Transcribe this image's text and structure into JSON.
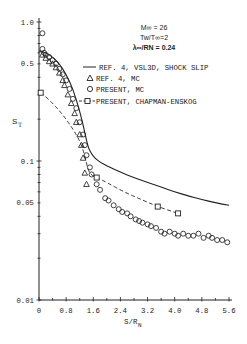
{
  "chart_data": {
    "type": "scatter",
    "title": "",
    "xlabel": "S/R",
    "xlabel_sub": "N",
    "ylabel": "S",
    "ylabel_sub": "T",
    "yscale": "log",
    "xlim": [
      0,
      5.6
    ],
    "ylim": [
      0.01,
      1.0
    ],
    "xticks": [
      0,
      0.4,
      0.8,
      1.2,
      1.6,
      2.0,
      2.4,
      2.8,
      3.2,
      3.6,
      4.0,
      4.4,
      4.8,
      5.2,
      5.6
    ],
    "xtick_labels": [
      {
        "v": 0,
        "t": "0"
      },
      {
        "v": 0.8,
        "t": "0.8"
      },
      {
        "v": 1.6,
        "t": "1.6"
      },
      {
        "v": 2.4,
        "t": "2.4"
      },
      {
        "v": 3.2,
        "t": "3.2"
      },
      {
        "v": 4.0,
        "t": "4.0"
      },
      {
        "v": 4.8,
        "t": "4.8"
      },
      {
        "v": 5.6,
        "t": "5.6"
      }
    ],
    "yticks": [
      0.01,
      0.02,
      0.03,
      0.04,
      0.05,
      0.06,
      0.07,
      0.08,
      0.09,
      0.1,
      0.2,
      0.3,
      0.4,
      0.5,
      0.6,
      0.7,
      0.8,
      0.9,
      1.0
    ],
    "ytick_labels": [
      {
        "v": 1.0,
        "t": "1.0"
      },
      {
        "v": 0.5,
        "t": "0.5"
      },
      {
        "v": 0.1,
        "t": "0.1"
      },
      {
        "v": 0.05,
        "t": "0.05"
      },
      {
        "v": 0.01,
        "t": "0.01"
      }
    ],
    "grid": false,
    "annotation": {
      "line1": "M∞ = 26",
      "line2": "Tw/T∞=2",
      "line3": "λ∞/RN = 0.24"
    },
    "legend": [
      {
        "marker": "line",
        "label": "REF. 4, VSL3D, SHOCK SLIP"
      },
      {
        "marker": "triangle",
        "label": "REF. 4, MC"
      },
      {
        "marker": "circle",
        "label": "PRESENT, MC"
      },
      {
        "marker": "dash-square",
        "label": "PRESENT, CHAPMAN-ENSKOG"
      }
    ],
    "series": [
      {
        "name": "REF. 4, VSL3D, SHOCK SLIP",
        "style": "solid",
        "x": [
          0.0,
          0.2,
          0.4,
          0.6,
          0.8,
          1.0,
          1.2,
          1.35,
          1.45,
          1.55,
          1.65,
          1.8,
          2.0,
          2.4,
          2.8,
          3.2,
          3.6,
          4.0,
          4.4,
          4.8,
          5.2,
          5.6
        ],
        "y": [
          0.62,
          0.6,
          0.56,
          0.5,
          0.42,
          0.33,
          0.23,
          0.16,
          0.125,
          0.112,
          0.105,
          0.098,
          0.092,
          0.083,
          0.076,
          0.07,
          0.065,
          0.06,
          0.056,
          0.053,
          0.05,
          0.048
        ]
      },
      {
        "name": "REF. 4, MC",
        "style": "triangle",
        "x": [
          0.1,
          0.2,
          0.3,
          0.4,
          0.5,
          0.6,
          0.7,
          0.75,
          0.85,
          0.95,
          1.05,
          1.1,
          1.2,
          1.25,
          1.3,
          1.35,
          1.4
        ],
        "y": [
          0.58,
          0.55,
          0.52,
          0.5,
          0.47,
          0.43,
          0.38,
          0.35,
          0.3,
          0.26,
          0.22,
          0.19,
          0.155,
          0.13,
          0.105,
          0.082,
          0.068
        ]
      },
      {
        "name": "PRESENT, MC",
        "style": "circle",
        "x": [
          0.1,
          0.1,
          0.15,
          0.2,
          0.3,
          0.4,
          0.5,
          0.6,
          0.7,
          0.8,
          0.9,
          1.0,
          1.1,
          1.2,
          1.3,
          1.35,
          1.4,
          1.5,
          1.55,
          1.7,
          1.8,
          1.95,
          2.05,
          2.2,
          2.35,
          2.45,
          2.6,
          2.7,
          2.85,
          2.95,
          3.05,
          3.2,
          3.3,
          3.45,
          3.6,
          3.7,
          3.85,
          4.0,
          4.1,
          4.25,
          4.4,
          4.55,
          4.7,
          4.85,
          5.0,
          5.1,
          5.25,
          5.4,
          5.55
        ],
        "y": [
          0.83,
          0.64,
          0.6,
          0.58,
          0.56,
          0.53,
          0.5,
          0.46,
          0.42,
          0.38,
          0.33,
          0.28,
          0.24,
          0.19,
          0.155,
          0.13,
          0.11,
          0.09,
          0.08,
          0.068,
          0.062,
          0.054,
          0.052,
          0.048,
          0.045,
          0.043,
          0.042,
          0.04,
          0.038,
          0.037,
          0.036,
          0.035,
          0.034,
          0.033,
          0.031,
          0.03,
          0.031,
          0.03,
          0.029,
          0.03,
          0.029,
          0.029,
          0.03,
          0.028,
          0.029,
          0.028,
          0.027,
          0.027,
          0.026
        ]
      },
      {
        "name": "PRESENT, CHAPMAN-ENSKOG",
        "style": "dash-square",
        "x": [
          0.05,
          0.2,
          0.4,
          0.6,
          0.8,
          1.0,
          1.2,
          1.35,
          1.45,
          1.55,
          1.7,
          2.0,
          2.5,
          3.0,
          3.5,
          4.1
        ],
        "y": [
          0.31,
          0.29,
          0.26,
          0.23,
          0.2,
          0.17,
          0.14,
          0.11,
          0.085,
          0.079,
          0.076,
          0.07,
          0.06,
          0.053,
          0.047,
          0.042
        ],
        "markers_at": [
          0,
          10,
          14,
          15
        ]
      }
    ]
  }
}
